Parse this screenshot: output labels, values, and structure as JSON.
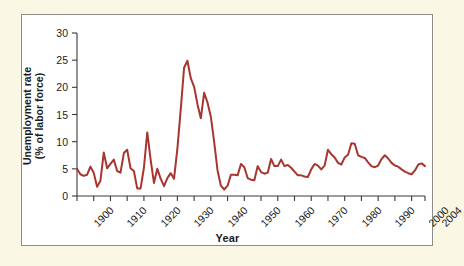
{
  "figure": {
    "background_color": "#faf7e4",
    "plot_background_color": "#ffffff",
    "border_color": "#8e8e88",
    "line_color": "#a8352f"
  },
  "chart_data": {
    "type": "line",
    "title": "",
    "xlabel": "Year",
    "ylabel": "Unemployment rate (% of labor force)",
    "ylabel_line1": "Unemployment rate",
    "ylabel_line2": "(% of labor force)",
    "xlim": [
      1900,
      2004
    ],
    "ylim": [
      0,
      30
    ],
    "yticks": [
      0,
      5,
      10,
      15,
      20,
      25,
      30
    ],
    "ytick_labels": [
      "0",
      "5",
      "10",
      "15",
      "20",
      "25",
      "30"
    ],
    "xticks": [
      1900,
      1905,
      1910,
      1915,
      1920,
      1925,
      1930,
      1935,
      1940,
      1945,
      1950,
      1955,
      1960,
      1965,
      1970,
      1975,
      1980,
      1985,
      1990,
      1995,
      2000,
      2004
    ],
    "xtick_labels_shown": [
      "1900",
      "1910",
      "1920",
      "1930",
      "1940",
      "1950",
      "1960",
      "1970",
      "1980",
      "1990",
      "2000",
      "2004"
    ],
    "xtick_labels_shown_values": [
      1900,
      1910,
      1920,
      1930,
      1940,
      1950,
      1960,
      1970,
      1980,
      1990,
      2000,
      2004
    ],
    "grid": false,
    "legend": "none",
    "series_name": "Unemployment rate",
    "x": [
      1900,
      1901,
      1902,
      1903,
      1904,
      1905,
      1906,
      1907,
      1908,
      1909,
      1910,
      1911,
      1912,
      1913,
      1914,
      1915,
      1916,
      1917,
      1918,
      1919,
      1920,
      1921,
      1922,
      1923,
      1924,
      1925,
      1926,
      1927,
      1928,
      1929,
      1930,
      1931,
      1932,
      1933,
      1934,
      1935,
      1936,
      1937,
      1938,
      1939,
      1940,
      1941,
      1942,
      1943,
      1944,
      1945,
      1946,
      1947,
      1948,
      1949,
      1950,
      1951,
      1952,
      1953,
      1954,
      1955,
      1956,
      1957,
      1958,
      1959,
      1960,
      1961,
      1962,
      1963,
      1964,
      1965,
      1966,
      1967,
      1968,
      1969,
      1970,
      1971,
      1972,
      1973,
      1974,
      1975,
      1976,
      1977,
      1978,
      1979,
      1980,
      1981,
      1982,
      1983,
      1984,
      1985,
      1986,
      1987,
      1988,
      1989,
      1990,
      1991,
      1992,
      1993,
      1994,
      1995,
      1996,
      1997,
      1998,
      1999,
      2000,
      2001,
      2002,
      2003,
      2004
    ],
    "values": [
      5.0,
      4.0,
      3.7,
      3.9,
      5.4,
      4.3,
      1.7,
      2.8,
      8.0,
      5.1,
      5.9,
      6.7,
      4.6,
      4.3,
      7.9,
      8.5,
      5.1,
      4.6,
      1.4,
      1.4,
      5.2,
      11.7,
      6.7,
      2.4,
      5.0,
      3.2,
      1.8,
      3.3,
      4.2,
      3.2,
      8.7,
      15.9,
      23.6,
      24.9,
      21.7,
      20.1,
      16.9,
      14.3,
      19.0,
      17.2,
      14.6,
      9.9,
      4.7,
      1.9,
      1.2,
      1.9,
      3.9,
      3.9,
      3.8,
      5.9,
      5.3,
      3.3,
      3.0,
      2.9,
      5.5,
      4.4,
      4.1,
      4.3,
      6.8,
      5.5,
      5.5,
      6.7,
      5.5,
      5.7,
      5.2,
      4.5,
      3.8,
      3.8,
      3.6,
      3.5,
      4.9,
      5.9,
      5.6,
      4.9,
      5.6,
      8.5,
      7.7,
      7.1,
      6.1,
      5.8,
      7.1,
      7.6,
      9.7,
      9.6,
      7.5,
      7.2,
      7.0,
      6.2,
      5.5,
      5.3,
      5.6,
      6.8,
      7.5,
      6.9,
      6.1,
      5.6,
      5.4,
      4.9,
      4.5,
      4.2,
      4.0,
      4.7,
      5.8,
      6.0,
      5.5
    ]
  }
}
